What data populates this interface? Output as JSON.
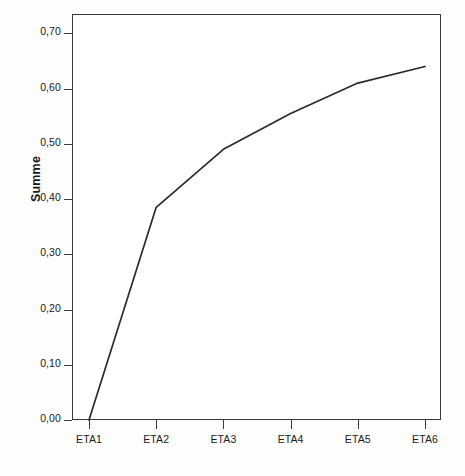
{
  "chart_data": {
    "type": "line",
    "title": "",
    "subtitle": "",
    "xlabel": "",
    "ylabel": "Summe",
    "categories": [
      "ETA1",
      "ETA2",
      "ETA3",
      "ETA4",
      "ETA5",
      "ETA6"
    ],
    "values": [
      0.0,
      0.385,
      0.49,
      0.555,
      0.61,
      0.64
    ],
    "series": [
      {
        "name": "Summe",
        "values": [
          0.0,
          0.385,
          0.49,
          0.555,
          0.61,
          0.64
        ]
      }
    ],
    "ylim": [
      0.0,
      0.735
    ],
    "ytick_values": [
      0.0,
      0.1,
      0.2,
      0.3,
      0.4,
      0.5,
      0.6,
      0.7
    ],
    "ytick_labels": [
      "0,00",
      "0,10",
      "0,20",
      "0,30",
      "0,40",
      "0,50",
      "0,60",
      "0,70"
    ],
    "xtick_labels": [
      "ETA1",
      "ETA2",
      "ETA3",
      "ETA4",
      "ETA5",
      "ETA6"
    ],
    "grid": false,
    "legend": null,
    "markers": false,
    "decimal_separator": ",",
    "line_color": "#2b2b2b",
    "axis_color": "#3a3a3a",
    "background_color": "#ffffff",
    "annotations": []
  }
}
